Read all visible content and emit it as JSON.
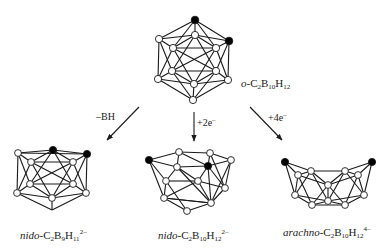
{
  "figure": {
    "type": "carborane cage transformation diagram",
    "colors": {
      "line": "#1a1a1a",
      "carbon_atom": "#000000",
      "boron_atom": "#ffffff"
    }
  },
  "top_structure": {
    "prefix": "o-",
    "formula_parts": [
      "C",
      "2",
      "B",
      "10",
      "H",
      "12"
    ],
    "label": "o-C2B10H12"
  },
  "arrows": [
    {
      "id": "left",
      "label_main": "–BH",
      "label_sup": ""
    },
    {
      "id": "middle",
      "label_main": "+2e",
      "label_sup": "–"
    },
    {
      "id": "right",
      "label_main": "+4e",
      "label_sup": "–"
    }
  ],
  "products": [
    {
      "id": "nido-c2b9",
      "prefix": "nido",
      "sep": "-",
      "formula_parts": [
        "C",
        "2",
        "B",
        "9",
        "H",
        "11"
      ],
      "charge": "2–",
      "label": "nido-C2B9H11 2–"
    },
    {
      "id": "nido-c2b10",
      "prefix": "nido",
      "sep": "-",
      "formula_parts": [
        "C",
        "2",
        "B",
        "10",
        "H",
        "12"
      ],
      "charge": "2–",
      "label": "nido-C2B10H12 2–"
    },
    {
      "id": "arachno-c2b10",
      "prefix": "arachno",
      "sep": "-",
      "formula_parts": [
        "C",
        "2",
        "B",
        "10",
        "H",
        "12"
      ],
      "charge": "4–",
      "label": "arachno-C2B10H12 4–"
    }
  ]
}
